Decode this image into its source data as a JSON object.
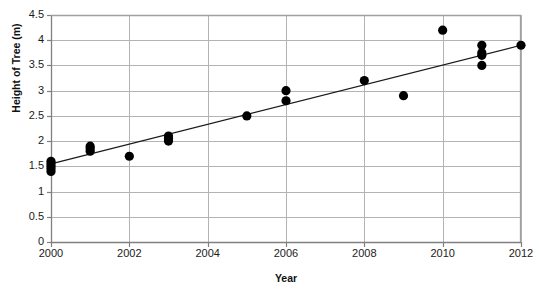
{
  "chart_data": {
    "type": "scatter",
    "title": "",
    "xlabel": "Year",
    "ylabel": "Height of Tree (m)",
    "xlim": [
      2000,
      2012
    ],
    "ylim": [
      0,
      4.5
    ],
    "ytick_step": 0.5,
    "xtick_step": 2,
    "grid": "both",
    "legend": "none",
    "x_tick_labels": [
      "2000",
      "2002",
      "2004",
      "2006",
      "2008",
      "2010",
      "2012"
    ],
    "y_tick_labels": [
      "0",
      "0.5",
      "1",
      "1.5",
      "2",
      "2.5",
      "3",
      "3.5",
      "4",
      "4.5"
    ],
    "marker": "filled-circle",
    "marker_color": "#000000",
    "points": [
      {
        "x": 2000,
        "y": 1.6
      },
      {
        "x": 2000,
        "y": 1.55
      },
      {
        "x": 2000,
        "y": 1.5
      },
      {
        "x": 2000,
        "y": 1.45
      },
      {
        "x": 2000,
        "y": 1.4
      },
      {
        "x": 2001,
        "y": 1.9
      },
      {
        "x": 2001,
        "y": 1.85
      },
      {
        "x": 2001,
        "y": 1.8
      },
      {
        "x": 2002,
        "y": 1.7
      },
      {
        "x": 2003,
        "y": 2.1
      },
      {
        "x": 2003,
        "y": 2.05
      },
      {
        "x": 2003,
        "y": 2.0
      },
      {
        "x": 2005,
        "y": 2.5
      },
      {
        "x": 2006,
        "y": 3.0
      },
      {
        "x": 2006,
        "y": 2.8
      },
      {
        "x": 2008,
        "y": 3.2
      },
      {
        "x": 2009,
        "y": 2.9
      },
      {
        "x": 2010,
        "y": 4.2
      },
      {
        "x": 2011,
        "y": 3.9
      },
      {
        "x": 2011,
        "y": 3.75
      },
      {
        "x": 2011,
        "y": 3.7
      },
      {
        "x": 2011,
        "y": 3.5
      },
      {
        "x": 2012,
        "y": 3.9
      }
    ],
    "trendline": {
      "visible": true,
      "color": "#1a1a1a",
      "x_start": 2000,
      "y_start": 1.55,
      "x_end": 2012,
      "y_end": 3.9
    },
    "axis_color": "#808080",
    "grid_color": "#b3b3b3",
    "background": "#ffffff"
  }
}
